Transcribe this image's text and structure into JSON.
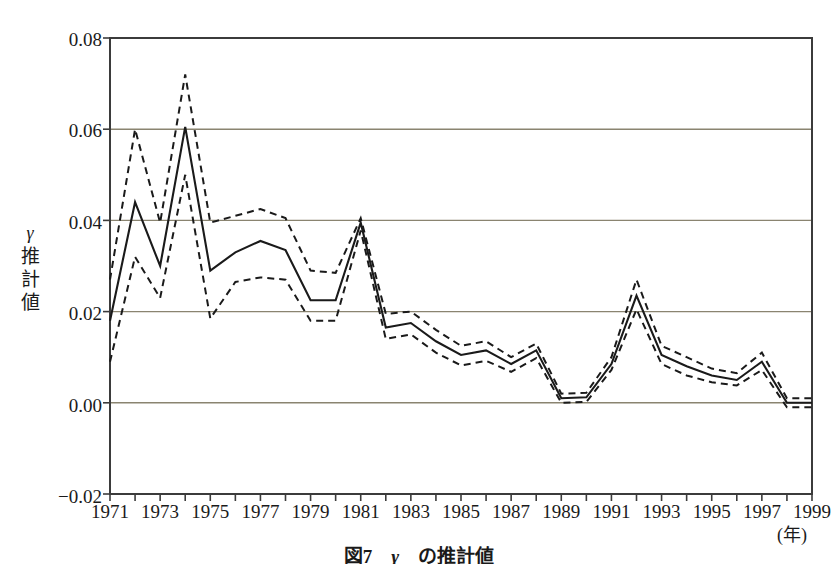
{
  "figure": {
    "caption_prefix": "図7",
    "caption_symbol": "γ",
    "caption_suffix": "の推計値",
    "caption_full": "図7　γ　の推計値"
  },
  "axes": {
    "y_label_lines": [
      "γ",
      "推",
      "計",
      "値"
    ],
    "y_ticks": [
      "0.08",
      "0.06",
      "0.04",
      "0.02",
      "0.00",
      "−0.02"
    ],
    "x_ticks": [
      "1971",
      "1973",
      "1975",
      "1977",
      "1979",
      "1981",
      "1983",
      "1985",
      "1987",
      "1989",
      "1991",
      "1993",
      "1995",
      "1997",
      "1999"
    ],
    "x_unit": "(年)"
  },
  "colors": {
    "line": "#1a1a1a",
    "grid": "#8a8470",
    "frame": "#3b3b3b",
    "background": "#ffffff"
  },
  "chart_data": {
    "type": "line",
    "xlabel": "(年)",
    "ylabel": "γ 推計値",
    "xlim": [
      1971,
      1999
    ],
    "ylim": [
      -0.02,
      0.08
    ],
    "ytick_values": [
      0.08,
      0.06,
      0.04,
      0.02,
      0.0,
      -0.02
    ],
    "grid": "horizontal",
    "legend": "none",
    "x": [
      1971,
      1972,
      1973,
      1974,
      1975,
      1976,
      1977,
      1978,
      1979,
      1980,
      1981,
      1982,
      1983,
      1984,
      1985,
      1986,
      1987,
      1988,
      1989,
      1990,
      1991,
      1992,
      1993,
      1994,
      1995,
      1996,
      1997,
      1998,
      1999
    ],
    "series": [
      {
        "name": "γ 推計値 (point estimate)",
        "style": "solid",
        "values": [
          0.018,
          0.044,
          0.03,
          0.0605,
          0.029,
          0.033,
          0.0355,
          0.0335,
          0.0225,
          0.0225,
          0.0395,
          0.0165,
          0.0175,
          0.0135,
          0.0105,
          0.0115,
          0.0085,
          0.0115,
          0.001,
          0.0012,
          0.0085,
          0.0235,
          0.0105,
          0.008,
          0.006,
          0.005,
          0.009,
          0.0,
          0.0
        ]
      },
      {
        "name": "上側信頼限界 (upper band)",
        "style": "dashed",
        "values": [
          0.027,
          0.06,
          0.0395,
          0.072,
          0.0395,
          0.041,
          0.0425,
          0.0405,
          0.029,
          0.0285,
          0.0405,
          0.0195,
          0.02,
          0.016,
          0.0125,
          0.0135,
          0.01,
          0.013,
          0.002,
          0.0022,
          0.01,
          0.027,
          0.0125,
          0.01,
          0.0075,
          0.0065,
          0.011,
          0.001,
          0.001
        ]
      },
      {
        "name": "下側信頼限界 (lower band)",
        "style": "dashed",
        "values": [
          0.009,
          0.032,
          0.023,
          0.05,
          0.0185,
          0.0265,
          0.0275,
          0.027,
          0.018,
          0.018,
          0.0378,
          0.014,
          0.015,
          0.011,
          0.0082,
          0.0092,
          0.0068,
          0.0098,
          0.0,
          0.0002,
          0.0072,
          0.0205,
          0.0085,
          0.006,
          0.0045,
          0.0038,
          0.0072,
          -0.001,
          -0.001
        ]
      }
    ]
  },
  "plot_geometry": {
    "left": 110,
    "right": 812,
    "top": 38,
    "bottom": 494
  }
}
